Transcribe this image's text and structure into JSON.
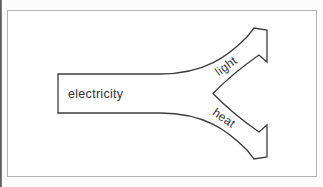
{
  "diagram": {
    "input_label": "electricity",
    "output_top_label": "light",
    "output_bottom_label": "heat"
  },
  "colors": {
    "line": "#3c3c3c",
    "text": "#333333",
    "frame_border": "#b3b3b3",
    "page_edge": "#5e5e5e",
    "fill": "#ffffff"
  }
}
